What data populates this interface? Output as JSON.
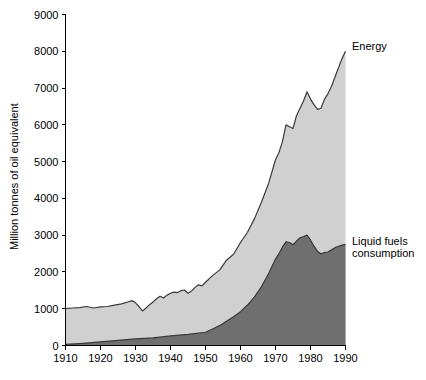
{
  "chart_data": {
    "type": "area",
    "title": "",
    "subtitle": "",
    "xlabel": "",
    "ylabel": "Million tonnes of oil equivalent",
    "xlim": [
      1910,
      1990
    ],
    "ylim": [
      0,
      9000
    ],
    "grid": false,
    "stacked": false,
    "legend_position": "right-inline",
    "y_ticks": [
      0,
      1000,
      2000,
      3000,
      4000,
      5000,
      6000,
      7000,
      8000,
      9000
    ],
    "y_tick_labels": [
      "0",
      "1000",
      "2000",
      "3000",
      "4000",
      "5000",
      "6000",
      "7000",
      "8000",
      "9000"
    ],
    "x_ticks": [
      1910,
      1920,
      1930,
      1940,
      1950,
      1960,
      1970,
      1980,
      1990
    ],
    "x_tick_labels": [
      "1910",
      "1920",
      "1930",
      "1940",
      "1950",
      "1960",
      "1970",
      "1980",
      "1990"
    ],
    "colors": {
      "energy_fill": "#d0d0d0",
      "liquid_fuels_fill": "#6f6f6f",
      "outline": "#3a3a3a",
      "axis": "#000000",
      "background": "#ffffff"
    },
    "series": [
      {
        "name": "Energy",
        "label": "Energy",
        "fill": "#d0d0d0",
        "x": [
          1910,
          1912,
          1914,
          1916,
          1918,
          1920,
          1922,
          1924,
          1926,
          1928,
          1929,
          1930,
          1931,
          1932,
          1933,
          1934,
          1935,
          1936,
          1937,
          1938,
          1939,
          1940,
          1941,
          1942,
          1943,
          1944,
          1945,
          1946,
          1947,
          1948,
          1949,
          1950,
          1952,
          1954,
          1956,
          1958,
          1960,
          1962,
          1964,
          1966,
          1968,
          1970,
          1971,
          1972,
          1973,
          1974,
          1975,
          1976,
          1977,
          1978,
          1979,
          1980,
          1981,
          1982,
          1983,
          1984,
          1985,
          1986,
          1987,
          1988,
          1989,
          1990
        ],
        "values": [
          1000,
          1020,
          1030,
          1060,
          1020,
          1050,
          1060,
          1100,
          1130,
          1190,
          1220,
          1160,
          1060,
          940,
          1020,
          1110,
          1180,
          1270,
          1340,
          1290,
          1370,
          1420,
          1450,
          1440,
          1490,
          1510,
          1420,
          1480,
          1580,
          1650,
          1620,
          1720,
          1900,
          2050,
          2320,
          2480,
          2800,
          3080,
          3450,
          3900,
          4400,
          5050,
          5250,
          5550,
          6000,
          5950,
          5900,
          6250,
          6450,
          6650,
          6900,
          6700,
          6550,
          6420,
          6450,
          6700,
          6850,
          7050,
          7300,
          7550,
          7800,
          8000
        ]
      },
      {
        "name": "Liquid fuels consumption",
        "label": "Liquid fuels\nconsumption",
        "label_line1": "Liquid fuels",
        "label_line2": "consumption",
        "fill": "#6f6f6f",
        "x": [
          1910,
          1915,
          1920,
          1925,
          1930,
          1935,
          1940,
          1945,
          1950,
          1952,
          1954,
          1956,
          1958,
          1960,
          1962,
          1964,
          1966,
          1968,
          1970,
          1971,
          1972,
          1973,
          1974,
          1975,
          1976,
          1977,
          1978,
          1979,
          1980,
          1981,
          1982,
          1983,
          1984,
          1985,
          1986,
          1987,
          1988,
          1989,
          1990
        ],
        "values": [
          30,
          60,
          100,
          140,
          180,
          210,
          260,
          300,
          360,
          450,
          540,
          660,
          780,
          920,
          1100,
          1320,
          1600,
          1950,
          2350,
          2500,
          2680,
          2820,
          2800,
          2740,
          2840,
          2930,
          2960,
          3000,
          2870,
          2700,
          2560,
          2490,
          2530,
          2540,
          2600,
          2660,
          2700,
          2730,
          2750
        ]
      }
    ]
  },
  "axis": {
    "y_title": "Million tonnes of oil equivalent"
  }
}
